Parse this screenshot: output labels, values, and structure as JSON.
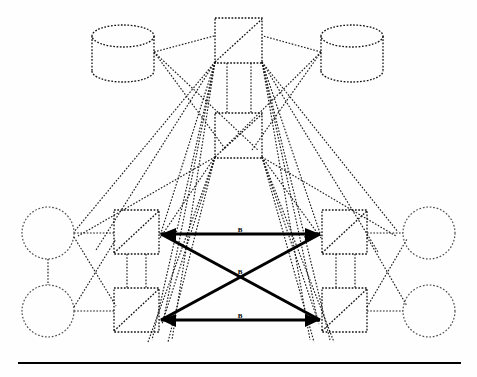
{
  "figure": {
    "background_color": "#fefefe",
    "width": 477,
    "height": 377,
    "solid_edge_color": "#000000",
    "dotted_edge_color": "#1a1a1a"
  },
  "labels": {
    "top_link": "B",
    "center_link": "B",
    "bottom_link": "B"
  },
  "nodes": {
    "databases": [
      {
        "name": "database-top-left",
        "cx": 123,
        "cy": 47,
        "rx": 31,
        "ry": 11,
        "height": 46
      },
      {
        "name": "database-top-right",
        "cx": 352,
        "cy": 47,
        "rx": 31,
        "ry": 11,
        "height": 46
      }
    ],
    "circles": [
      {
        "name": "circle-left-upper",
        "cx": 48,
        "cy": 233,
        "r": 26
      },
      {
        "name": "circle-left-lower",
        "cx": 48,
        "cy": 311,
        "r": 26
      },
      {
        "name": "circle-right-upper",
        "cx": 429,
        "cy": 233,
        "r": 26
      },
      {
        "name": "circle-right-lower",
        "cx": 429,
        "cy": 311,
        "r": 26
      }
    ],
    "routers": [
      {
        "name": "router-top",
        "x": 215,
        "y": 18,
        "w": 47,
        "h": 45
      },
      {
        "name": "router-upper-middle",
        "x": 215,
        "y": 113,
        "w": 47,
        "h": 45
      },
      {
        "name": "router-left-upper",
        "x": 114,
        "y": 210,
        "w": 45,
        "h": 44
      },
      {
        "name": "router-left-lower",
        "x": 114,
        "y": 288,
        "w": 45,
        "h": 44
      },
      {
        "name": "router-right-upper",
        "x": 322,
        "y": 210,
        "w": 45,
        "h": 44
      },
      {
        "name": "router-right-lower",
        "x": 322,
        "y": 288,
        "w": 45,
        "h": 44
      }
    ],
    "core_junctions": [
      {
        "name": "junction-left-upper",
        "x": 161,
        "y": 234
      },
      {
        "name": "junction-left-lower",
        "x": 161,
        "y": 320
      },
      {
        "name": "junction-right-upper",
        "x": 320,
        "y": 234
      },
      {
        "name": "junction-right-lower",
        "x": 320,
        "y": 320
      }
    ]
  },
  "links": {
    "backbone": [
      {
        "name": "backbone-top",
        "from": "junction-left-upper",
        "to": "junction-right-upper",
        "label": "B"
      },
      {
        "name": "backbone-diagonal-down",
        "from": "junction-left-upper",
        "to": "junction-right-lower",
        "label": ""
      },
      {
        "name": "backbone-diagonal-up",
        "from": "junction-left-lower",
        "to": "junction-right-upper",
        "label": "B"
      },
      {
        "name": "backbone-bottom",
        "from": "junction-left-lower",
        "to": "junction-right-lower",
        "label": "B"
      }
    ],
    "access_count": 32
  },
  "baseline": {
    "name": "figure-baseline-rule",
    "x1": 18,
    "x2": 461,
    "y": 363
  }
}
